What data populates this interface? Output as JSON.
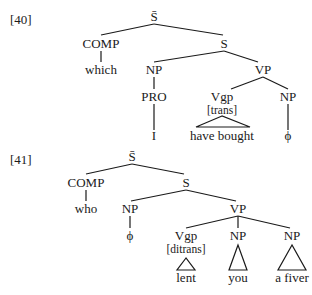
{
  "examples": [
    {
      "number": "[40]",
      "nodes": {
        "root": "S̄",
        "comp": "COMP",
        "s": "S",
        "comp_word": "which",
        "np_subj": "NP",
        "vp": "VP",
        "pro": "PRO",
        "vgp": "Vgp",
        "vgp_feature": "[trans]",
        "np_obj": "NP",
        "subj_word": "I",
        "verb_words": "have bought",
        "obj_word": "ϕ"
      }
    },
    {
      "number": "[41]",
      "nodes": {
        "root": "S̄",
        "comp": "COMP",
        "s": "S",
        "comp_word": "who",
        "np_subj": "NP",
        "vp": "VP",
        "subj_word": "ϕ",
        "vgp": "Vgp",
        "vgp_feature": "[ditrans]",
        "np_obj1": "NP",
        "np_obj2": "NP",
        "verb_word": "lent",
        "obj1_word": "you",
        "obj2_word": "a fiver"
      }
    }
  ]
}
